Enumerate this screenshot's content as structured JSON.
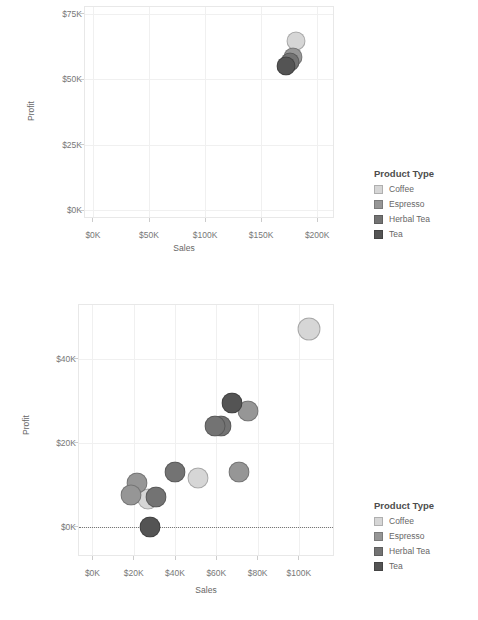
{
  "legend": {
    "title": "Product Type",
    "items": [
      {
        "label": "Coffee",
        "color": "#d6d6d6"
      },
      {
        "label": "Espresso",
        "color": "#969696"
      },
      {
        "label": "Herbal Tea",
        "color": "#737373"
      },
      {
        "label": "Tea",
        "color": "#545454"
      }
    ]
  },
  "chart_data": [
    {
      "type": "scatter",
      "title": "",
      "xlabel": "Sales",
      "ylabel": "Profit",
      "xlim": [
        -8000,
        215000
      ],
      "ylim": [
        -3000,
        78000
      ],
      "xticks": [
        0,
        50000,
        100000,
        150000,
        200000
      ],
      "xticklabels": [
        "$0K",
        "$50K",
        "$100K",
        "$150K",
        "$200K"
      ],
      "yticks": [
        0,
        25000,
        50000,
        75000
      ],
      "yticklabels": [
        "$0K",
        "$25K",
        "$50K",
        "$75K"
      ],
      "grid": true,
      "zero_reference_line": false,
      "legend_position": "right",
      "series": [
        {
          "name": "Coffee",
          "color": "#d6d6d6",
          "points": [
            {
              "x": 181000,
              "y": 64500,
              "size": 19
            }
          ]
        },
        {
          "name": "Espresso",
          "color": "#969696",
          "points": [
            {
              "x": 178000,
              "y": 58500,
              "size": 19
            }
          ]
        },
        {
          "name": "Herbal Tea",
          "color": "#737373",
          "points": [
            {
              "x": 176000,
              "y": 56500,
              "size": 19
            }
          ]
        },
        {
          "name": "Tea",
          "color": "#545454",
          "points": [
            {
              "x": 172000,
              "y": 55000,
              "size": 19
            }
          ]
        }
      ]
    },
    {
      "type": "scatter",
      "title": "",
      "xlabel": "Sales",
      "ylabel": "Profit",
      "xlim": [
        -7000,
        117000
      ],
      "ylim": [
        -7000,
        53000
      ],
      "xticks": [
        0,
        20000,
        40000,
        60000,
        80000,
        100000
      ],
      "xticklabels": [
        "$0K",
        "$20K",
        "$40K",
        "$60K",
        "$80K",
        "$100K"
      ],
      "yticks": [
        0,
        20000,
        40000
      ],
      "yticklabels": [
        "$0K",
        "$20K",
        "$40K"
      ],
      "grid": true,
      "zero_reference_line": true,
      "legend_position": "right",
      "series": [
        {
          "name": "Coffee",
          "color": "#d6d6d6",
          "points": [
            {
              "x": 105000,
              "y": 47000,
              "size": 23
            },
            {
              "x": 51000,
              "y": 11500,
              "size": 21
            },
            {
              "x": 27000,
              "y": 6500,
              "size": 21
            }
          ]
        },
        {
          "name": "Espresso",
          "color": "#969696",
          "points": [
            {
              "x": 75500,
              "y": 27500,
              "size": 21
            },
            {
              "x": 71000,
              "y": 13000,
              "size": 21
            },
            {
              "x": 21500,
              "y": 10500,
              "size": 21
            },
            {
              "x": 18500,
              "y": 7500,
              "size": 21
            }
          ]
        },
        {
          "name": "Herbal Tea",
          "color": "#737373",
          "points": [
            {
              "x": 62500,
              "y": 24000,
              "size": 21
            },
            {
              "x": 59500,
              "y": 24000,
              "size": 21
            },
            {
              "x": 40000,
              "y": 13000,
              "size": 21
            },
            {
              "x": 31000,
              "y": 7000,
              "size": 21
            }
          ]
        },
        {
          "name": "Tea",
          "color": "#545454",
          "points": [
            {
              "x": 67500,
              "y": 29500,
              "size": 21
            },
            {
              "x": 28000,
              "y": 0,
              "size": 21
            }
          ]
        }
      ]
    }
  ]
}
